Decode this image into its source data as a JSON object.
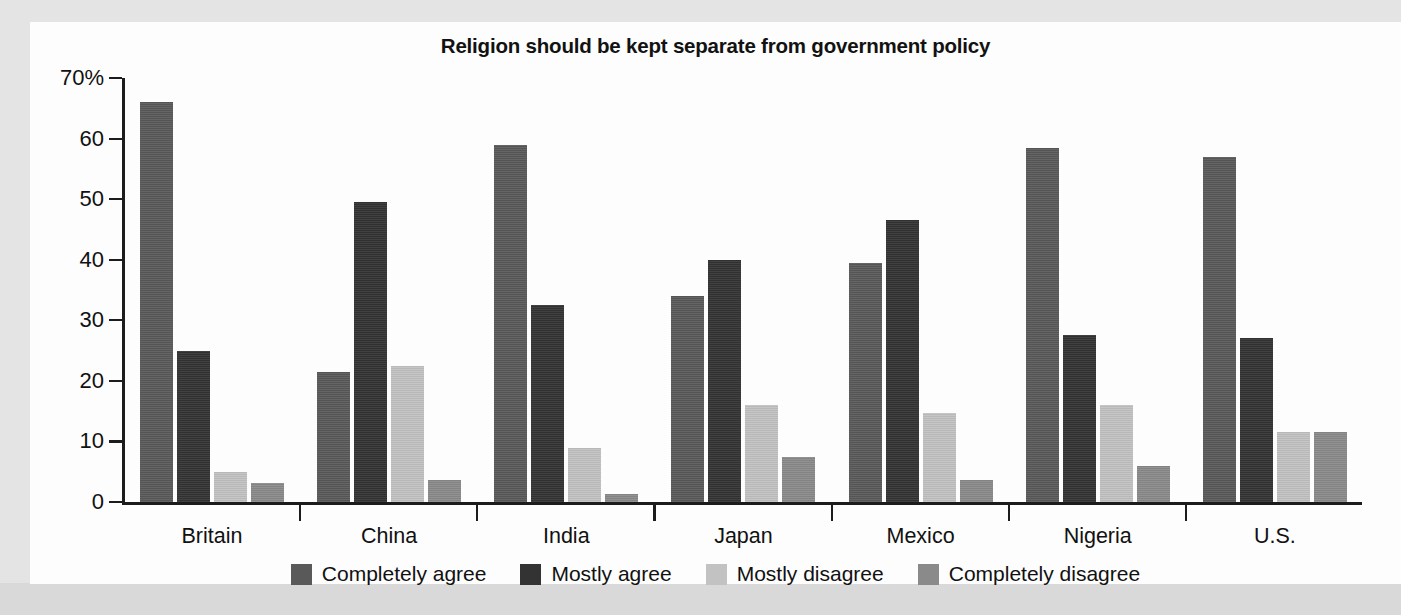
{
  "chart_data": {
    "type": "bar",
    "title": "Religion should be kept separate from government policy",
    "xlabel": "",
    "ylabel": "",
    "ylim": [
      0,
      70
    ],
    "yticks": [
      0,
      10,
      20,
      30,
      40,
      50,
      60,
      70
    ],
    "ytick_labels": [
      "0",
      "10",
      "20",
      "30",
      "40",
      "50",
      "60",
      "70%"
    ],
    "grid": false,
    "legend_position": "bottom",
    "categories": [
      "Britain",
      "China",
      "India",
      "Japan",
      "Mexico",
      "Nigeria",
      "U.S."
    ],
    "series": [
      {
        "name": "Completely agree",
        "color": "#595959",
        "values": [
          66.0,
          21.5,
          59.0,
          34.0,
          39.5,
          58.5,
          57.0
        ]
      },
      {
        "name": "Mostly agree",
        "color": "#333333",
        "values": [
          25.0,
          49.5,
          32.5,
          40.0,
          46.5,
          27.5,
          27.0
        ]
      },
      {
        "name": "Mostly disagree",
        "color": "#c2c2c2",
        "values": [
          5.0,
          22.5,
          9.0,
          16.0,
          14.7,
          16.0,
          11.5
        ]
      },
      {
        "name": "Completely disagree",
        "color": "#8a8a8a",
        "values": [
          3.2,
          3.6,
          1.4,
          7.4,
          3.6,
          6.0,
          11.5
        ]
      }
    ]
  },
  "legend": {
    "items": [
      {
        "label": "Completely agree"
      },
      {
        "label": "Mostly agree"
      },
      {
        "label": "Mostly disagree"
      },
      {
        "label": "Completely disagree"
      }
    ]
  }
}
